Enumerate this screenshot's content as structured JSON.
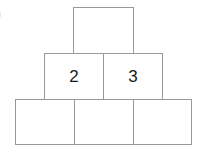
{
  "edge_mark": ")",
  "pyramid": {
    "rows": [
      {
        "cells": [
          {
            "value": ""
          }
        ]
      },
      {
        "cells": [
          {
            "value": "2"
          },
          {
            "value": "3"
          }
        ]
      },
      {
        "cells": [
          {
            "value": ""
          },
          {
            "value": ""
          },
          {
            "value": ""
          }
        ]
      }
    ],
    "border_color": "#9a9a9a",
    "text_color": "#1a1a1a"
  }
}
